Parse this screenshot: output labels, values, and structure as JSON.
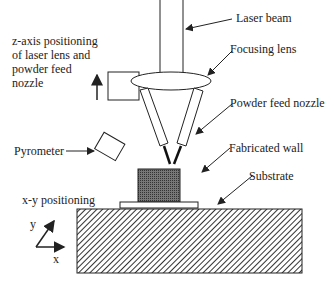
{
  "labels": {
    "laser_beam": "Laser beam",
    "focusing_lens": "Focusing lens",
    "powder_feed_nozzle": "Powder feed nozzle",
    "fabricated_wall": "Fabricated wall",
    "substrate": "Substrate",
    "pyrometer": "Pyrometer",
    "xy_positioning": "x-y positioning",
    "z_axis_line1": "z-axis positioning",
    "z_axis_line2": "of laser lens and",
    "z_axis_line3": "powder feed",
    "z_axis_line4": "nozzle",
    "axis_x": "x",
    "axis_y": "y"
  },
  "colors": {
    "line": "#222222",
    "wall_fill": "#555555",
    "stage_hatch": "#333333"
  }
}
